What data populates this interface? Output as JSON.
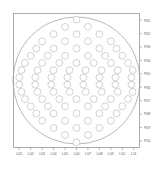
{
  "figure": {
    "title": "",
    "background_color": "#ffffff",
    "frame_color": "#8a8a8a",
    "vessel_outline_color": "#9a9a9a",
    "tube_outline_color": "#b6b6b6",
    "tube_fill_color": "#ffffff",
    "tick_label_color": "#5d5d5d"
  },
  "chart_data": {
    "type": "scatter",
    "title": "",
    "xlabel": "",
    "ylabel": "",
    "grid": false,
    "legend": "none",
    "xlim": [
      0.5,
      11.5
    ],
    "ylim": [
      0.5,
      13.5
    ],
    "x_tick_labels": [
      "L01",
      "L02",
      "L03",
      "L04",
      "L05",
      "L06",
      "L07",
      "L08",
      "L09",
      "L10",
      "L11"
    ],
    "x_tick_values": [
      1,
      2,
      3,
      4,
      5,
      6,
      7,
      8,
      9,
      10,
      11
    ],
    "y_tick_labels": [
      "P01",
      "P02",
      "P03",
      "P04",
      "P05",
      "P06",
      "P07",
      "P08",
      "P09",
      "P10"
    ],
    "y_tick_values": [
      1,
      2,
      3,
      4,
      5,
      6,
      7,
      8,
      9,
      10
    ],
    "y_axis_position": "right",
    "x_axis_position": "bottom",
    "vessel": {
      "shape": "circle",
      "center_x": 6.0,
      "center_y": 7.0,
      "radius": 5.55
    },
    "marker": {
      "shape": "circle",
      "radius": 0.3,
      "filled": false
    },
    "points": [
      {
        "x": 6.0,
        "y": 1.0
      },
      {
        "x": 5.0,
        "y": 1.7
      },
      {
        "x": 7.0,
        "y": 1.7
      },
      {
        "x": 4.0,
        "y": 2.4
      },
      {
        "x": 6.0,
        "y": 2.4
      },
      {
        "x": 8.0,
        "y": 2.4
      },
      {
        "x": 3.0,
        "y": 3.1
      },
      {
        "x": 5.0,
        "y": 3.1
      },
      {
        "x": 7.0,
        "y": 3.1
      },
      {
        "x": 9.0,
        "y": 3.1
      },
      {
        "x": 2.5,
        "y": 3.8
      },
      {
        "x": 4.0,
        "y": 3.8
      },
      {
        "x": 6.0,
        "y": 3.8
      },
      {
        "x": 8.0,
        "y": 3.8
      },
      {
        "x": 9.5,
        "y": 3.8
      },
      {
        "x": 2.0,
        "y": 4.5
      },
      {
        "x": 3.5,
        "y": 4.5
      },
      {
        "x": 5.0,
        "y": 4.5
      },
      {
        "x": 7.0,
        "y": 4.5
      },
      {
        "x": 8.5,
        "y": 4.5
      },
      {
        "x": 10.0,
        "y": 4.5
      },
      {
        "x": 1.5,
        "y": 5.2
      },
      {
        "x": 3.0,
        "y": 5.2
      },
      {
        "x": 4.5,
        "y": 5.2
      },
      {
        "x": 6.0,
        "y": 5.2
      },
      {
        "x": 7.5,
        "y": 5.2
      },
      {
        "x": 9.0,
        "y": 5.2
      },
      {
        "x": 10.5,
        "y": 5.2
      },
      {
        "x": 1.2,
        "y": 5.9
      },
      {
        "x": 2.6,
        "y": 5.9
      },
      {
        "x": 4.0,
        "y": 5.9
      },
      {
        "x": 5.4,
        "y": 5.9
      },
      {
        "x": 6.8,
        "y": 5.9
      },
      {
        "x": 8.2,
        "y": 5.9
      },
      {
        "x": 9.6,
        "y": 5.9
      },
      {
        "x": 10.9,
        "y": 5.9
      },
      {
        "x": 1.0,
        "y": 6.6
      },
      {
        "x": 2.4,
        "y": 6.6
      },
      {
        "x": 3.8,
        "y": 6.6
      },
      {
        "x": 5.2,
        "y": 6.6
      },
      {
        "x": 6.6,
        "y": 6.6
      },
      {
        "x": 8.0,
        "y": 6.6
      },
      {
        "x": 9.4,
        "y": 6.6
      },
      {
        "x": 10.8,
        "y": 6.6
      },
      {
        "x": 1.0,
        "y": 7.3
      },
      {
        "x": 2.4,
        "y": 7.3
      },
      {
        "x": 3.8,
        "y": 7.3
      },
      {
        "x": 5.2,
        "y": 7.3
      },
      {
        "x": 6.6,
        "y": 7.3
      },
      {
        "x": 8.0,
        "y": 7.3
      },
      {
        "x": 9.4,
        "y": 7.3
      },
      {
        "x": 10.8,
        "y": 7.3
      },
      {
        "x": 1.2,
        "y": 8.0
      },
      {
        "x": 2.6,
        "y": 8.0
      },
      {
        "x": 4.0,
        "y": 8.0
      },
      {
        "x": 5.4,
        "y": 8.0
      },
      {
        "x": 6.8,
        "y": 8.0
      },
      {
        "x": 8.2,
        "y": 8.0
      },
      {
        "x": 9.6,
        "y": 8.0
      },
      {
        "x": 10.9,
        "y": 8.0
      },
      {
        "x": 1.5,
        "y": 8.7
      },
      {
        "x": 3.0,
        "y": 8.7
      },
      {
        "x": 4.5,
        "y": 8.7
      },
      {
        "x": 6.0,
        "y": 8.7
      },
      {
        "x": 7.5,
        "y": 8.7
      },
      {
        "x": 9.0,
        "y": 8.7
      },
      {
        "x": 10.5,
        "y": 8.7
      },
      {
        "x": 2.0,
        "y": 9.4
      },
      {
        "x": 3.5,
        "y": 9.4
      },
      {
        "x": 5.0,
        "y": 9.4
      },
      {
        "x": 7.0,
        "y": 9.4
      },
      {
        "x": 8.5,
        "y": 9.4
      },
      {
        "x": 10.0,
        "y": 9.4
      },
      {
        "x": 2.5,
        "y": 10.1
      },
      {
        "x": 4.0,
        "y": 10.1
      },
      {
        "x": 6.0,
        "y": 10.1
      },
      {
        "x": 8.0,
        "y": 10.1
      },
      {
        "x": 9.5,
        "y": 10.1
      },
      {
        "x": 3.0,
        "y": 10.8
      },
      {
        "x": 5.0,
        "y": 10.8
      },
      {
        "x": 7.0,
        "y": 10.8
      },
      {
        "x": 9.0,
        "y": 10.8
      },
      {
        "x": 4.0,
        "y": 11.5
      },
      {
        "x": 6.0,
        "y": 11.5
      },
      {
        "x": 8.0,
        "y": 11.5
      },
      {
        "x": 5.0,
        "y": 12.2
      },
      {
        "x": 7.0,
        "y": 12.2
      },
      {
        "x": 6.0,
        "y": 12.9
      }
    ]
  }
}
